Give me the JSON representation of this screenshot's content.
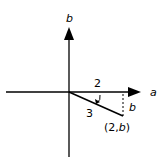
{
  "diagram": {
    "axes": {
      "horizontal_label": "a",
      "vertical_label": "b"
    },
    "triangle": {
      "adjacent_label": "2",
      "hypotenuse_label": "3",
      "opposite_label": "b",
      "point_label": "(2,b)",
      "point_label_open": "(2,",
      "point_label_var": "b",
      "point_label_close": ")"
    },
    "colors": {
      "stroke": "#000000",
      "background": "#ffffff"
    }
  }
}
